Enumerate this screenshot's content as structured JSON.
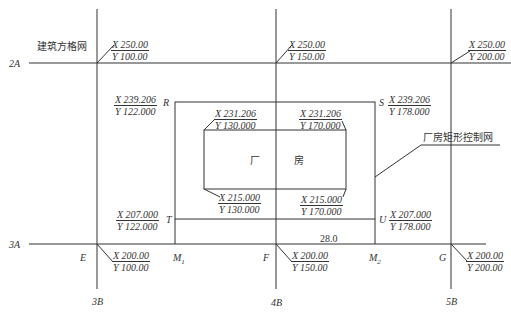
{
  "labels": {
    "grid_name": "建筑方格网",
    "control_name": "厂房矩形控制网",
    "building_left": "厂",
    "building_right": "房",
    "row_2A": "2A",
    "row_3A": "3A",
    "col_3B": "3B",
    "col_4B": "4B",
    "col_5B": "5B",
    "pt_R": "R",
    "pt_S": "S",
    "pt_T": "T",
    "pt_U": "U",
    "pt_E": "E",
    "pt_F": "F",
    "pt_G": "G",
    "pt_M1": "M",
    "pt_M1_sub": "1",
    "pt_M2": "M",
    "pt_M2_sub": "2",
    "dist": "28.0"
  },
  "coords": {
    "grid_2A_3B": {
      "x": "X 250.00",
      "y": "Y 100.00"
    },
    "grid_2A_4B": {
      "x": "X 250.00",
      "y": "Y 150.00"
    },
    "grid_2A_5B": {
      "x": "X 250.00",
      "y": "Y 200.00"
    },
    "R": {
      "x": "X 239.206",
      "y": "Y 122.000"
    },
    "S": {
      "x": "X 239.206",
      "y": "Y 178.000"
    },
    "bld_tl": {
      "x": "X 231.206",
      "y": "Y 130.000"
    },
    "bld_tr": {
      "x": "X 231.206",
      "y": "Y 170.000"
    },
    "bld_bl": {
      "x": "X 215.000",
      "y": "Y 130.000"
    },
    "bld_br": {
      "x": "X 215.000",
      "y": "Y 170.000"
    },
    "T": {
      "x": "X 207.000",
      "y": "Y 122.000"
    },
    "U": {
      "x": "X 207.000",
      "y": "Y 178.000"
    },
    "E": {
      "x": "X 200.00",
      "y": "Y 100.00"
    },
    "F": {
      "x": "X 200.00",
      "y": "Y 150.00"
    },
    "G": {
      "x": "X 200.00",
      "y": "Y 200.00"
    }
  }
}
